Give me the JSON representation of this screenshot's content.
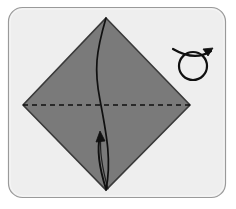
{
  "panel": {
    "name": "origami-step-diagram",
    "background_color": "#eeeeee",
    "border_color": "#9a9a9a",
    "corner_radius": 14,
    "x": 8,
    "y": 7,
    "width": 218,
    "height": 191
  },
  "figure": {
    "title": "Origami fold step: square base turned on point",
    "shape_name": "diamond",
    "fill_color": "#7a7a7a",
    "stroke_color": "#333333",
    "vertices": {
      "top": [
        106,
        18
      ],
      "right": [
        190,
        105
      ],
      "bottom": [
        106,
        190
      ],
      "left": [
        23,
        105
      ]
    }
  },
  "fold_lines": [
    {
      "name": "valley-fold-horizontal",
      "style": "dashed",
      "color": "#111111",
      "from": [
        23,
        105
      ],
      "to": [
        190,
        105
      ],
      "dash": "5 4"
    }
  ],
  "creases": [
    {
      "name": "vertical-crease-curve",
      "style": "solid",
      "color": "#101010",
      "from": [
        106,
        18
      ],
      "to": [
        106,
        190
      ],
      "description": "curved crease bulging from top point down to bottom point"
    }
  ],
  "arrows": [
    {
      "name": "fold-up-arrow",
      "color": "#101010",
      "direction": "up",
      "tail": [
        104,
        188
      ],
      "head": [
        100,
        133
      ],
      "description": "curved arrow from bottom point pointing upward indicating the flap is folded up"
    }
  ],
  "symbols": [
    {
      "name": "turn-over-symbol",
      "color": "#101010",
      "center": [
        193,
        62
      ],
      "radius": 15,
      "description": "loop with arrowhead meaning turn the model over"
    }
  ],
  "labels": {
    "step_number": "",
    "caption": ""
  }
}
